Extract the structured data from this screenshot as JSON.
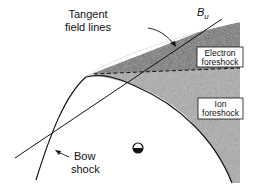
{
  "diagram": {
    "type": "foreshock-geometry",
    "labels": {
      "tangent": [
        "Tangent",
        "field lines"
      ],
      "field": {
        "symbol": "B",
        "subscript": "u"
      },
      "electron_foreshock": [
        "Electron",
        "foreshock"
      ],
      "ion_foreshock": [
        "Ion",
        "foreshock"
      ],
      "bow_shock": [
        "Bow",
        "shock"
      ]
    },
    "colors": {
      "line": "#111111",
      "shade_dark": "#6e6e6e",
      "shade_light": "#a9a9a9",
      "background": "#ffffff"
    },
    "elements": [
      {
        "id": "tangent-field-line",
        "kind": "line"
      },
      {
        "id": "bow-shock",
        "kind": "curve"
      },
      {
        "id": "electron-foreshock-region",
        "kind": "shaded-region"
      },
      {
        "id": "ion-foreshock-region",
        "kind": "shaded-region"
      },
      {
        "id": "foreshock-boundary",
        "kind": "dashed-line"
      },
      {
        "id": "earth-symbol",
        "kind": "symbol"
      }
    ]
  }
}
